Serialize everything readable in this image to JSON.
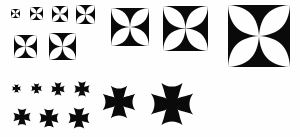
{
  "sheet": {
    "title": "Cross Ornament Specimen",
    "background_color": "#fefefe",
    "ink_color": "#0a0a0a",
    "width": 300,
    "height": 137
  },
  "groups": [
    {
      "id": "maltese-in-square",
      "name": "Cross Maltese in Square",
      "style_label": "maltese-square",
      "description": "Solid square field with four white lens-shaped cutouts forming a black Maltese cross",
      "items": [
        {
          "name": "maltese-square-1",
          "size_label": "6pt",
          "x": 11,
          "y": 9,
          "size": 9
        },
        {
          "name": "maltese-square-2",
          "size_label": "8pt",
          "x": 30,
          "y": 7,
          "size": 13
        },
        {
          "name": "maltese-square-3",
          "size_label": "10pt",
          "x": 52,
          "y": 6,
          "size": 16
        },
        {
          "name": "maltese-square-4",
          "size_label": "12pt",
          "x": 76,
          "y": 5,
          "size": 19
        },
        {
          "name": "maltese-square-5",
          "size_label": "14pt",
          "x": 14,
          "y": 35,
          "size": 23
        },
        {
          "name": "maltese-square-6",
          "size_label": "18pt",
          "x": 49,
          "y": 33,
          "size": 27
        },
        {
          "name": "maltese-square-7",
          "size_label": "30pt",
          "x": 111,
          "y": 8,
          "size": 38
        },
        {
          "name": "maltese-square-8",
          "size_label": "36pt",
          "x": 163,
          "y": 6,
          "size": 45
        },
        {
          "name": "maltese-square-9",
          "size_label": "48pt",
          "x": 228,
          "y": 5,
          "size": 62
        }
      ]
    },
    {
      "id": "cross-pattee",
      "name": "Cross Pattee",
      "style_label": "pattee-open",
      "description": "Standalone black cross with concave flared arm ends, no surrounding square",
      "items": [
        {
          "name": "cross-pattee-1",
          "size_label": "6pt",
          "x": 12,
          "y": 84,
          "size": 9
        },
        {
          "name": "cross-pattee-2",
          "size_label": "8pt",
          "x": 31,
          "y": 83,
          "size": 11
        },
        {
          "name": "cross-pattee-3",
          "size_label": "10pt",
          "x": 51,
          "y": 82,
          "size": 14
        },
        {
          "name": "cross-pattee-4",
          "size_label": "12pt",
          "x": 74,
          "y": 81,
          "size": 16
        },
        {
          "name": "cross-pattee-5",
          "size_label": "14pt",
          "x": 13,
          "y": 108,
          "size": 18
        },
        {
          "name": "cross-pattee-6",
          "size_label": "18pt",
          "x": 39,
          "y": 108,
          "size": 20
        },
        {
          "name": "cross-pattee-7",
          "size_label": "24pt",
          "x": 68,
          "y": 107,
          "size": 22
        },
        {
          "name": "cross-pattee-8",
          "size_label": "30pt",
          "x": 102,
          "y": 85,
          "size": 34
        },
        {
          "name": "cross-pattee-9",
          "size_label": "36pt",
          "x": 150,
          "y": 82,
          "size": 44
        }
      ]
    }
  ]
}
